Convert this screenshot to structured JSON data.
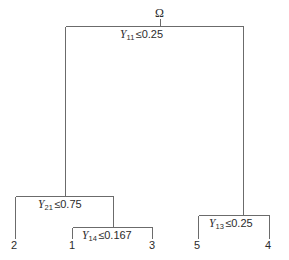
{
  "figure": {
    "title_symbol": "Ω",
    "line_color": "#6b6b6b",
    "text_color": "#2b2b2b",
    "background": "#ffffff"
  },
  "splits": [
    {
      "id": "root-split",
      "variable": "Y",
      "subscript": "11",
      "operator": "≤",
      "value": "0.25",
      "text": "Y11 ≤ 0.25"
    },
    {
      "id": "left-split",
      "variable": "Y",
      "subscript": "21",
      "operator": "≤",
      "value": "0.75",
      "text": "Y21 ≤ 0.75"
    },
    {
      "id": "inner-split",
      "variable": "Y",
      "subscript": "14",
      "operator": "≤",
      "value": "0.167",
      "text": "Y14 ≤ 0.167"
    },
    {
      "id": "right-split",
      "variable": "Y",
      "subscript": "13",
      "operator": "≤",
      "value": "0.25",
      "text": "Y13 ≤ 0.25"
    }
  ],
  "leaves": [
    {
      "id": "leaf-2",
      "label": "2"
    },
    {
      "id": "leaf-1",
      "label": "1"
    },
    {
      "id": "leaf-3",
      "label": "3"
    },
    {
      "id": "leaf-5",
      "label": "5"
    },
    {
      "id": "leaf-4",
      "label": "4"
    }
  ]
}
